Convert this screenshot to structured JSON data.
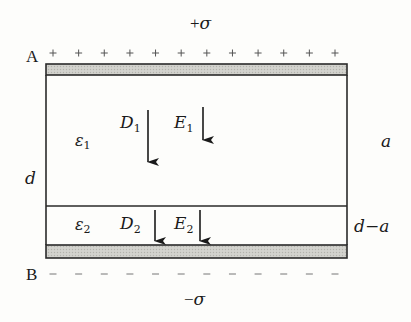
{
  "diagram": {
    "top_plate": {
      "label": "A",
      "charge_label": "+σ",
      "charge_sign": "+",
      "sign_count": 12
    },
    "bottom_plate": {
      "label": "B",
      "charge_label": "−σ",
      "charge_sign": "−",
      "sign_count": 12
    },
    "gap_label": "d",
    "layer1": {
      "permittivity_symbol": "ε",
      "permittivity_sub": "1",
      "thickness_label": "a",
      "D_symbol": "D",
      "D_sub": "1",
      "E_symbol": "E",
      "E_sub": "1",
      "field_direction": "down"
    },
    "layer2": {
      "permittivity_symbol": "ε",
      "permittivity_sub": "2",
      "thickness_label": "d−a",
      "D_symbol": "D",
      "D_sub": "2",
      "E_symbol": "E",
      "E_sub": "2",
      "field_direction": "down"
    },
    "colors": {
      "line": "#2a2a2a",
      "plate_fill": "#c9c9c4",
      "background": "#fdfdfb"
    }
  }
}
